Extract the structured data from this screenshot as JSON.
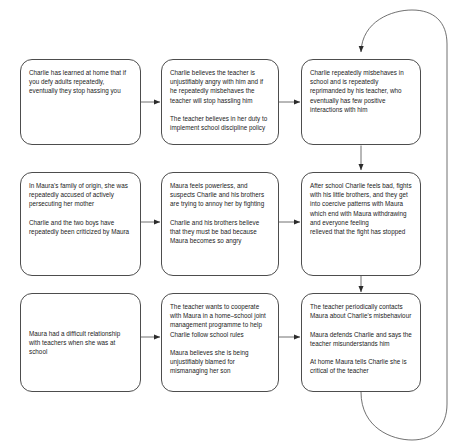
{
  "diagram": {
    "type": "flowchart",
    "canvas": {
      "width": 456,
      "height": 446,
      "background": "#ffffff"
    },
    "style": {
      "box_border": "#4d4d4d",
      "text": "#1a1a1a",
      "arrow": "#4d4d4d"
    },
    "nodes": [
      {
        "id": "r1c1",
        "paragraphs": [
          "Charlie has learned at home that if you defy adults repeatedly, eventually they stop hassing you"
        ]
      },
      {
        "id": "r1c2",
        "paragraphs": [
          "Charlie believes the teacher is unjustifiably angry with him and if he repeatedly misbehaves the teacher will stop hassling him",
          "The teacher believes in her duty to implement school discipline policy"
        ]
      },
      {
        "id": "r1c3",
        "paragraphs": [
          "Charlie repeatedly misbehaves in school and is repeatedly reprimanded by his teacher, who eventually has few positive interactions with him"
        ]
      },
      {
        "id": "r2c1",
        "paragraphs": [
          "In Maura's family of origin, she was repeatedly accused of actively persecuting her mother",
          "Charlie and the two boys have repeatedly been criticized by Maura"
        ]
      },
      {
        "id": "r2c2",
        "paragraphs": [
          "Maura feels powerless, and suspects Charlie and his brothers are trying to annoy her by fighting",
          "Charlie and his brothers believe that they must be bad because Maura becomes so angry"
        ]
      },
      {
        "id": "r2c3",
        "paragraphs": [
          "After school Charlie feels bad, fights with his little brothers, and they get into coercive patterns with Maura which end with Maura withdrawing and everyone feeling",
          "relieved that the fight has stopped"
        ]
      },
      {
        "id": "r3c1",
        "paragraphs": [
          "Maura had a difficult relationship  with teachers when she was at school"
        ]
      },
      {
        "id": "r3c2",
        "paragraphs": [
          "The teacher wants to cooperate with Maura in a home–school joint management programme to help Charlie follow school rules",
          "Maura believes she is being unjustifiably blamed for mismanaging her son"
        ]
      },
      {
        "id": "r3c3",
        "paragraphs": [
          "The teacher periodically contacts Maura about Charlie's misbehaviour",
          "Maura defends Charlie and says the teacher misunderstands him",
          "At home Maura tells Charlie she is critical of the teacher"
        ]
      }
    ],
    "edges": [
      {
        "id": "e1",
        "from": "r1c1",
        "to": "r1c2",
        "direction": "right"
      },
      {
        "id": "e2",
        "from": "r1c2",
        "to": "r1c3",
        "direction": "right"
      },
      {
        "id": "e3",
        "from": "r2c1",
        "to": "r2c2",
        "direction": "right"
      },
      {
        "id": "e4",
        "from": "r2c2",
        "to": "r2c3",
        "direction": "right"
      },
      {
        "id": "e5",
        "from": "r3c1",
        "to": "r3c2",
        "direction": "right"
      },
      {
        "id": "e6",
        "from": "r3c2",
        "to": "r3c3",
        "direction": "right"
      },
      {
        "id": "e7",
        "from": "r1c3",
        "to": "r2c3",
        "direction": "down"
      },
      {
        "id": "e8",
        "from": "r2c3",
        "to": "r3c3",
        "direction": "down"
      },
      {
        "id": "e9",
        "from": "r3c3",
        "to": "r1c3",
        "direction": "feedback-loop"
      }
    ]
  }
}
